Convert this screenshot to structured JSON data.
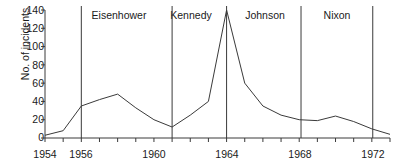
{
  "chart_data": {
    "type": "line",
    "title": "",
    "xlabel": "",
    "ylabel": "No. of incidents",
    "xlim": [
      1954,
      1973
    ],
    "ylim": [
      0,
      140
    ],
    "grid": false,
    "legend": "none",
    "x_ticks": [
      1954,
      1955,
      1956,
      1957,
      1958,
      1959,
      1960,
      1961,
      1962,
      1963,
      1964,
      1965,
      1966,
      1967,
      1968,
      1969,
      1970,
      1971,
      1972,
      1973
    ],
    "x_tick_labels": [
      "1954",
      "",
      "1956",
      "",
      "",
      "",
      "1960",
      "",
      "",
      "",
      "1964",
      "",
      "",
      "",
      "1968",
      "",
      "",
      "",
      "1972",
      ""
    ],
    "y_ticks": [
      0,
      20,
      40,
      60,
      80,
      100,
      120,
      140
    ],
    "y_tick_labels": [
      "0",
      "20",
      "40",
      "60",
      "80",
      "100",
      "120",
      "140"
    ],
    "x": [
      1954,
      1955,
      1956,
      1957,
      1958,
      1959,
      1960,
      1961,
      1962,
      1963,
      1964,
      1965,
      1966,
      1967,
      1968,
      1969,
      1970,
      1971,
      1972,
      1973
    ],
    "values": [
      3,
      8,
      35,
      42,
      48,
      33,
      20,
      12,
      25,
      40,
      140,
      60,
      35,
      25,
      20,
      19,
      24,
      18,
      10,
      4
    ],
    "annotations": [
      {
        "label": "Eisenhower",
        "start_year": 1956,
        "end_year": 1961,
        "label_x": 1958.5
      },
      {
        "label": "Kennedy",
        "start_year": 1961,
        "end_year": 1964,
        "label_x": 1962.4
      },
      {
        "label": "Johnson",
        "start_year": 1964,
        "end_year": 1968.1,
        "label_x": 1966.1
      },
      {
        "label": "Nixon",
        "start_year": 1968.1,
        "end_year": 1972.05,
        "label_x": 1970.0
      }
    ],
    "divider_years": [
      1956,
      1961,
      1964,
      1968.1,
      1972.05
    ],
    "line_color": "#3a3a3a",
    "axis_color": "#3a3a3a",
    "divider_color": "#3a3a3a"
  }
}
